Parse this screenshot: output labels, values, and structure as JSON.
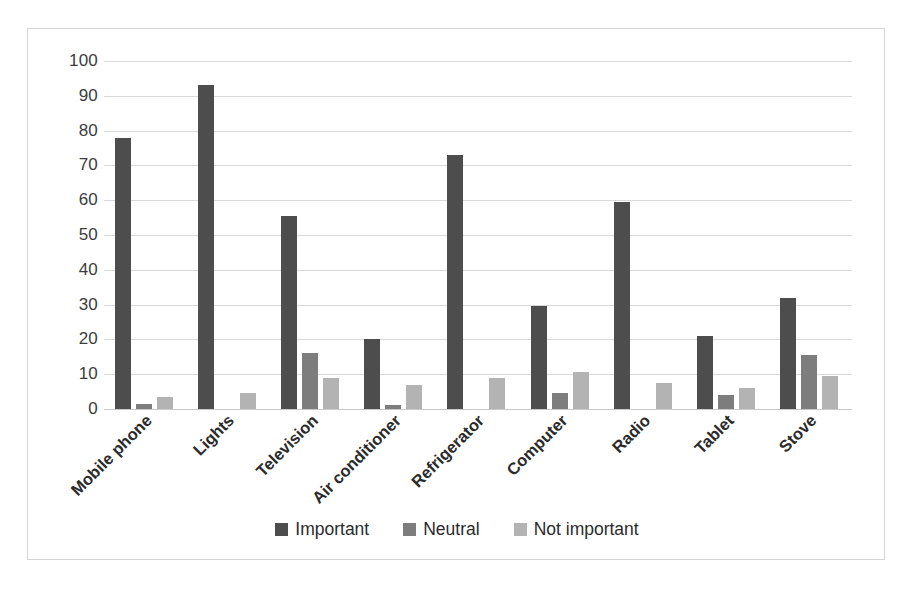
{
  "chart_data": {
    "type": "bar",
    "title": "",
    "xlabel": "",
    "ylabel": "",
    "ylim": [
      0,
      100
    ],
    "ytick_step": 10,
    "yticks": [
      100,
      90,
      80,
      70,
      60,
      50,
      40,
      30,
      20,
      10,
      0
    ],
    "grid": true,
    "legend_position": "bottom",
    "categories": [
      "Mobile phone",
      "Lights",
      "Television",
      "Air conditioner",
      "Refrigerator",
      "Computer",
      "Radio",
      "Tablet",
      "Stove"
    ],
    "series": [
      {
        "name": "Important",
        "color": "#4d4d4d",
        "values": [
          78,
          93,
          55.5,
          20,
          73,
          29.5,
          59.5,
          21,
          32
        ]
      },
      {
        "name": "Neutral",
        "color": "#7d7d7d",
        "values": [
          1.5,
          0,
          16,
          1.2,
          0,
          4.5,
          0,
          4,
          15.5
        ]
      },
      {
        "name": "Not important",
        "color": "#b3b3b3",
        "values": [
          3.5,
          4.5,
          9,
          7,
          9,
          10.5,
          7.5,
          6,
          9.5
        ]
      }
    ]
  },
  "legend": {
    "items": [
      {
        "label": "Important",
        "color": "#4d4d4d"
      },
      {
        "label": "Neutral",
        "color": "#7d7d7d"
      },
      {
        "label": "Not important",
        "color": "#b3b3b3"
      }
    ]
  },
  "colors": {
    "important": "#4d4d4d",
    "neutral": "#7d7d7d",
    "not_important": "#b3b3b3",
    "gridline": "#d9d9d9",
    "border": "#d4d4d4",
    "background": "#ffffff",
    "text": "#2b2b2b"
  }
}
